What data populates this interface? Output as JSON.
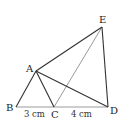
{
  "diagram": {
    "points": {
      "A": {
        "label": "A",
        "x": 36,
        "y": 71
      },
      "B": {
        "label": "B",
        "x": 16,
        "y": 107
      },
      "C": {
        "label": "C",
        "x": 54,
        "y": 107
      },
      "D": {
        "label": "D",
        "x": 108,
        "y": 107
      },
      "E": {
        "label": "E",
        "x": 102,
        "y": 27
      }
    },
    "segments": [
      {
        "from": "A",
        "to": "B",
        "style": "dark"
      },
      {
        "from": "A",
        "to": "C",
        "style": "dark"
      },
      {
        "from": "A",
        "to": "E",
        "style": "dark"
      },
      {
        "from": "A",
        "to": "D",
        "style": "dark"
      },
      {
        "from": "E",
        "to": "D",
        "style": "dark"
      },
      {
        "from": "B",
        "to": "C",
        "style": "light"
      },
      {
        "from": "C",
        "to": "D",
        "style": "light"
      },
      {
        "from": "C",
        "to": "E",
        "style": "light"
      }
    ],
    "measurements": {
      "BC": "3 cm",
      "CD": "4 cm"
    },
    "colors": {
      "dark": "#333333",
      "light": "#9a9a9a"
    }
  }
}
